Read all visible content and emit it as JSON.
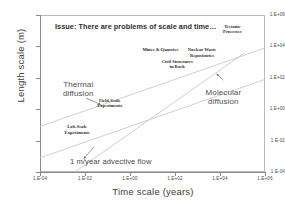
{
  "chart_data": {
    "type": "line",
    "title": "Issue: There are problems of scale and time…",
    "xlabel": "Time scale (years)",
    "ylabel": "Length scale (m)",
    "xscale": "log",
    "yscale": "log",
    "xlim": [
      -4,
      6
    ],
    "ylim": [
      -4,
      6
    ],
    "grid": false,
    "legend": "none",
    "xticks": [
      "1.E-04",
      "1.E-02",
      "1.E+00",
      "1.E+02",
      "1.E+04",
      "1.E+06"
    ],
    "xtick_exponents": [
      -4,
      -2,
      0,
      2,
      4,
      6
    ],
    "yticks": [
      "1.E+06",
      "1.E+04",
      "1.E+02",
      "1.E+00",
      "1.E-02",
      "1.E-04"
    ],
    "ytick_exponents": [
      6,
      4,
      2,
      0,
      -2,
      -4
    ],
    "series": [
      {
        "name": "1 m/year advective flow",
        "slope": 1.0,
        "x_log": [
          -2.45,
          5.1
        ],
        "y_log": [
          -4.0,
          3.6
        ],
        "color": "#c9c9c9"
      },
      {
        "name": "Thermal diffusion",
        "slope": 0.5,
        "x_log": [
          -4.0,
          6.0
        ],
        "y_log": [
          -1.1,
          3.9
        ],
        "color": "#c9c9c9"
      },
      {
        "name": "Molecular diffusion",
        "slope": 0.5,
        "x_log": [
          -4.0,
          6.0
        ],
        "y_log": [
          -3.1,
          1.9
        ],
        "color": "#c9c9c9"
      }
    ],
    "annotations": [
      {
        "text": "Tectonic\nProcesses",
        "x_log": 4.55,
        "y_log": 5.05,
        "style": "point"
      },
      {
        "text": "Nuclear Waste\nRepositories",
        "x_log": 3.2,
        "y_log": 3.55,
        "style": "point"
      },
      {
        "text": "Mines & Quarries",
        "x_log": 1.35,
        "y_log": 3.6,
        "style": "point"
      },
      {
        "text": "Civil Structures\nin Rock",
        "x_log": 2.1,
        "y_log": 2.8,
        "style": "point"
      },
      {
        "text": "Field-Scale\nExperiments",
        "x_log": -0.9,
        "y_log": 0.35,
        "style": "point"
      },
      {
        "text": "Lab-Scale\nExperiments",
        "x_log": -2.35,
        "y_log": -1.35,
        "style": "point"
      },
      {
        "text": "Thermal\ndiffusion",
        "x_log": -2.3,
        "y_log": 1.45,
        "style": "line"
      },
      {
        "text": "Molecular\ndiffusion",
        "x_log": 4.15,
        "y_log": 0.95,
        "style": "line"
      },
      {
        "text": "1 m/year advective flow",
        "x_log": -0.45,
        "y_log": -3.4,
        "style": "flow"
      }
    ],
    "leader_arrows": [
      {
        "from": [
          -1.95,
          0.7
        ],
        "to": [
          -1.3,
          0.3
        ],
        "target": "thermal-diffusion"
      },
      {
        "from": [
          4.15,
          1.85
        ],
        "to": [
          3.85,
          2.25
        ],
        "target": "molecular-diffusion"
      },
      {
        "from": [
          -1.6,
          -2.4
        ],
        "to": [
          -2.05,
          -3.15
        ],
        "target": "advective-flow"
      }
    ]
  }
}
